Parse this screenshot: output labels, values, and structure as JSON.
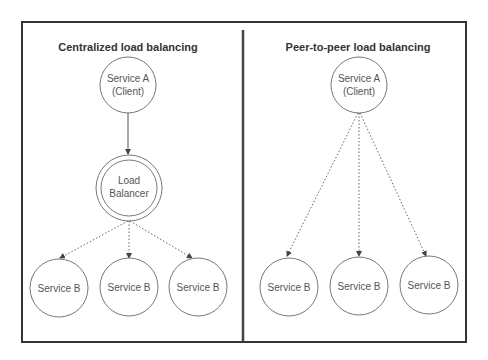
{
  "panels": [
    {
      "title": "Centralized load balancing",
      "client": {
        "line1": "Service A",
        "line2": "(Client)"
      },
      "balancer": {
        "line1": "Load",
        "line2": "Balancer"
      },
      "services": [
        "Service B",
        "Service B",
        "Service B"
      ]
    },
    {
      "title": "Peer-to-peer load balancing",
      "client": {
        "line1": "Service A",
        "line2": "(Client)"
      },
      "services": [
        "Service B",
        "Service B",
        "Service B"
      ]
    }
  ],
  "colors": {
    "frame": "#333333",
    "stroke": "#777777",
    "text": "#555555"
  }
}
